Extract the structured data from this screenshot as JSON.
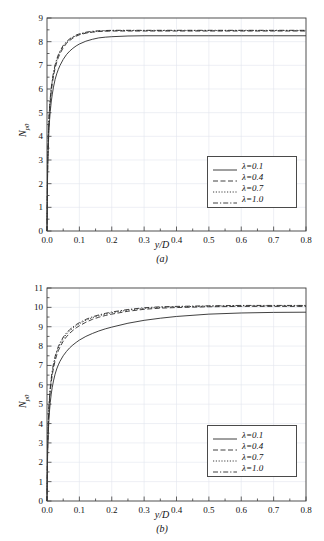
{
  "figure": {
    "panels": [
      {
        "id": "a",
        "caption": "(a)",
        "xlabel": "y/D",
        "ylabel_main": "N",
        "ylabel_sub": "p0"
      },
      {
        "id": "b",
        "caption": "(b)",
        "xlabel": "y/D",
        "ylabel_main": "N",
        "ylabel_sub": "p0"
      }
    ],
    "legend_labels": [
      "λ=0.1",
      "λ=0.4",
      "λ=0.7",
      "λ=1.0"
    ],
    "colors": {
      "axis": "#3c3c3c",
      "grid": "#e2e6ee",
      "curve": "#2b2b2b",
      "legend_border": "#4a4a4a",
      "background": "#ffffff"
    }
  },
  "chart_data": [
    {
      "type": "line",
      "title": "",
      "panel": "(a)",
      "xlabel": "y/D",
      "ylabel": "N_p0",
      "xlim": [
        0.0,
        0.8
      ],
      "ylim": [
        0,
        9
      ],
      "xticks": [
        0.0,
        0.1,
        0.2,
        0.3,
        0.4,
        0.5,
        0.6,
        0.7,
        0.8
      ],
      "xtick_labels": [
        "0.0",
        "0.1",
        "0.2",
        "0.3",
        "0.4",
        "0.5",
        "0.6",
        "0.7",
        "0.8"
      ],
      "yticks": [
        0,
        1,
        2,
        3,
        4,
        5,
        6,
        7,
        8,
        9
      ],
      "ytick_labels": [
        "0",
        "1",
        "2",
        "3",
        "4",
        "5",
        "6",
        "7",
        "8",
        "9"
      ],
      "xminor_step": 0.05,
      "grid": true,
      "legend_position": "lower right",
      "series": [
        {
          "name": "λ=0.1",
          "dash": "solid",
          "asymptote": 8.25,
          "x": [
            0.0,
            0.002,
            0.004,
            0.006,
            0.008,
            0.01,
            0.013,
            0.016,
            0.02,
            0.025,
            0.03,
            0.035,
            0.04,
            0.05,
            0.06,
            0.07,
            0.08,
            0.09,
            0.1,
            0.12,
            0.14,
            0.16,
            0.18,
            0.2,
            0.25,
            0.3,
            0.4,
            0.5,
            0.6,
            0.7,
            0.8
          ],
          "y": [
            0.0,
            2.6,
            3.6,
            4.25,
            4.7,
            5.05,
            5.45,
            5.75,
            6.08,
            6.4,
            6.64,
            6.83,
            6.99,
            7.25,
            7.45,
            7.6,
            7.72,
            7.82,
            7.9,
            8.02,
            8.1,
            8.16,
            8.19,
            8.21,
            8.24,
            8.25,
            8.25,
            8.25,
            8.25,
            8.25,
            8.25
          ]
        },
        {
          "name": "λ=0.4",
          "dash": "dashed",
          "asymptote": 8.45,
          "x": [
            0.0,
            0.002,
            0.004,
            0.006,
            0.008,
            0.01,
            0.013,
            0.016,
            0.02,
            0.025,
            0.03,
            0.035,
            0.04,
            0.05,
            0.06,
            0.07,
            0.08,
            0.09,
            0.1,
            0.12,
            0.14,
            0.16,
            0.18,
            0.2,
            0.25,
            0.3,
            0.4,
            0.5,
            0.6,
            0.7,
            0.8
          ],
          "y": [
            0.0,
            2.85,
            3.92,
            4.6,
            5.08,
            5.45,
            5.88,
            6.2,
            6.55,
            6.88,
            7.13,
            7.33,
            7.49,
            7.74,
            7.92,
            8.05,
            8.15,
            8.23,
            8.29,
            8.36,
            8.4,
            8.43,
            8.44,
            8.45,
            8.45,
            8.45,
            8.45,
            8.45,
            8.45,
            8.45,
            8.45
          ]
        },
        {
          "name": "λ=0.7",
          "dash": "dotted",
          "asymptote": 8.47,
          "x": [
            0.0,
            0.002,
            0.004,
            0.006,
            0.008,
            0.01,
            0.013,
            0.016,
            0.02,
            0.025,
            0.03,
            0.035,
            0.04,
            0.05,
            0.06,
            0.07,
            0.08,
            0.09,
            0.1,
            0.12,
            0.14,
            0.16,
            0.18,
            0.2,
            0.25,
            0.3,
            0.4,
            0.5,
            0.6,
            0.7,
            0.8
          ],
          "y": [
            0.0,
            2.92,
            4.0,
            4.7,
            5.18,
            5.55,
            5.98,
            6.3,
            6.64,
            6.97,
            7.21,
            7.4,
            7.56,
            7.8,
            7.97,
            8.09,
            8.18,
            8.26,
            8.31,
            8.38,
            8.42,
            8.45,
            8.46,
            8.47,
            8.47,
            8.47,
            8.47,
            8.47,
            8.47,
            8.47,
            8.47
          ]
        },
        {
          "name": "λ=1.0",
          "dash": "dashdot",
          "asymptote": 8.48,
          "x": [
            0.0,
            0.002,
            0.004,
            0.006,
            0.008,
            0.01,
            0.013,
            0.016,
            0.02,
            0.025,
            0.03,
            0.035,
            0.04,
            0.05,
            0.06,
            0.07,
            0.08,
            0.09,
            0.1,
            0.12,
            0.14,
            0.16,
            0.18,
            0.2,
            0.25,
            0.3,
            0.4,
            0.5,
            0.6,
            0.7,
            0.8
          ],
          "y": [
            0.0,
            2.96,
            4.05,
            4.76,
            5.24,
            5.61,
            6.04,
            6.36,
            6.7,
            7.02,
            7.26,
            7.45,
            7.6,
            7.84,
            8.0,
            8.12,
            8.21,
            8.28,
            8.33,
            8.4,
            8.44,
            8.46,
            8.47,
            8.48,
            8.48,
            8.48,
            8.48,
            8.48,
            8.48,
            8.48,
            8.48
          ]
        }
      ]
    },
    {
      "type": "line",
      "title": "",
      "panel": "(b)",
      "xlabel": "y/D",
      "ylabel": "N_p0",
      "xlim": [
        0.0,
        0.8
      ],
      "ylim": [
        0,
        11
      ],
      "xticks": [
        0.0,
        0.1,
        0.2,
        0.3,
        0.4,
        0.5,
        0.6,
        0.7,
        0.8
      ],
      "xtick_labels": [
        "0.0",
        "0.1",
        "0.2",
        "0.3",
        "0.4",
        "0.5",
        "0.6",
        "0.7",
        "0.8"
      ],
      "yticks": [
        0,
        1,
        2,
        3,
        4,
        5,
        6,
        7,
        8,
        9,
        10,
        11
      ],
      "ytick_labels": [
        "0",
        "1",
        "2",
        "3",
        "4",
        "5",
        "6",
        "7",
        "8",
        "9",
        "10",
        "11"
      ],
      "xminor_step": 0.05,
      "grid": true,
      "legend_position": "lower right",
      "series": [
        {
          "name": "λ=0.1",
          "dash": "solid",
          "asymptote": 9.75,
          "x": [
            0.0,
            0.002,
            0.004,
            0.006,
            0.008,
            0.01,
            0.013,
            0.016,
            0.02,
            0.025,
            0.03,
            0.035,
            0.04,
            0.05,
            0.06,
            0.07,
            0.08,
            0.09,
            0.1,
            0.12,
            0.14,
            0.16,
            0.18,
            0.2,
            0.25,
            0.3,
            0.35,
            0.4,
            0.5,
            0.6,
            0.7,
            0.8
          ],
          "y": [
            0.0,
            2.55,
            3.55,
            4.22,
            4.7,
            5.08,
            5.52,
            5.85,
            6.2,
            6.55,
            6.82,
            7.03,
            7.21,
            7.5,
            7.72,
            7.91,
            8.06,
            8.19,
            8.31,
            8.5,
            8.65,
            8.78,
            8.89,
            8.98,
            9.18,
            9.33,
            9.44,
            9.53,
            9.65,
            9.71,
            9.74,
            9.75
          ]
        },
        {
          "name": "λ=0.4",
          "dash": "dashed",
          "asymptote": 10.05,
          "x": [
            0.0,
            0.002,
            0.004,
            0.006,
            0.008,
            0.01,
            0.013,
            0.016,
            0.02,
            0.025,
            0.03,
            0.035,
            0.04,
            0.05,
            0.06,
            0.07,
            0.08,
            0.09,
            0.1,
            0.12,
            0.14,
            0.16,
            0.18,
            0.2,
            0.25,
            0.3,
            0.35,
            0.4,
            0.5,
            0.6,
            0.7,
            0.8
          ],
          "y": [
            0.0,
            2.9,
            4.0,
            4.72,
            5.25,
            5.65,
            6.12,
            6.48,
            6.86,
            7.24,
            7.53,
            7.76,
            7.95,
            8.25,
            8.48,
            8.66,
            8.81,
            8.94,
            9.05,
            9.23,
            9.38,
            9.49,
            9.58,
            9.65,
            9.8,
            9.9,
            9.96,
            9.99,
            10.03,
            10.05,
            10.05,
            10.05
          ]
        },
        {
          "name": "λ=0.7",
          "dash": "dotted",
          "asymptote": 10.08,
          "x": [
            0.0,
            0.002,
            0.004,
            0.006,
            0.008,
            0.01,
            0.013,
            0.016,
            0.02,
            0.025,
            0.03,
            0.035,
            0.04,
            0.05,
            0.06,
            0.07,
            0.08,
            0.09,
            0.1,
            0.12,
            0.14,
            0.16,
            0.18,
            0.2,
            0.25,
            0.3,
            0.35,
            0.4,
            0.5,
            0.6,
            0.7,
            0.8
          ],
          "y": [
            0.0,
            2.98,
            4.1,
            4.84,
            5.38,
            5.78,
            6.26,
            6.62,
            7.0,
            7.38,
            7.67,
            7.9,
            8.09,
            8.39,
            8.61,
            8.79,
            8.93,
            9.05,
            9.16,
            9.33,
            9.47,
            9.57,
            9.65,
            9.72,
            9.86,
            9.95,
            10.0,
            10.03,
            10.06,
            10.08,
            10.08,
            10.08
          ]
        },
        {
          "name": "λ=1.0",
          "dash": "dashdot",
          "asymptote": 10.1,
          "x": [
            0.0,
            0.002,
            0.004,
            0.006,
            0.008,
            0.01,
            0.013,
            0.016,
            0.02,
            0.025,
            0.03,
            0.035,
            0.04,
            0.05,
            0.06,
            0.07,
            0.08,
            0.09,
            0.1,
            0.12,
            0.14,
            0.16,
            0.18,
            0.2,
            0.25,
            0.3,
            0.35,
            0.4,
            0.5,
            0.6,
            0.7,
            0.8
          ],
          "y": [
            0.0,
            3.02,
            4.16,
            4.9,
            5.44,
            5.85,
            6.33,
            6.7,
            7.08,
            7.46,
            7.75,
            7.98,
            8.16,
            8.46,
            8.68,
            8.85,
            8.99,
            9.11,
            9.21,
            9.38,
            9.51,
            9.61,
            9.69,
            9.76,
            9.89,
            9.98,
            10.03,
            10.05,
            10.08,
            10.1,
            10.1,
            10.1
          ]
        }
      ]
    }
  ]
}
